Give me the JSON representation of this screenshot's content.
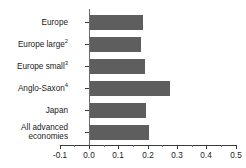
{
  "chart_data": {
    "type": "bar",
    "orientation": "horizontal",
    "title": "",
    "subtitle": "",
    "xlabel": "",
    "ylabel": "",
    "categories": [
      "Europe",
      "Europe large",
      "Europe small",
      "Anglo-Saxon",
      "Japan",
      "All advanced economies"
    ],
    "category_footnotes": [
      "",
      "2",
      "3",
      "4",
      "",
      ""
    ],
    "values": [
      0.185,
      0.178,
      0.19,
      0.275,
      0.195,
      0.205
    ],
    "xlim": [
      -0.1,
      0.5
    ],
    "xticks": [
      -0.1,
      0.0,
      0.1,
      0.2,
      0.3,
      0.4,
      0.5
    ],
    "xticklabels": [
      "-0.1",
      "0.0",
      "0.1",
      "0.2",
      "0.3",
      "0.4",
      "0.5"
    ],
    "grid": false,
    "legend": false,
    "bar_color": "#5e5e5e",
    "axis_color": "#3a3a3a",
    "background_color": "#ffffff"
  },
  "axis": {
    "tick_labels": [
      "-0.1",
      "0.0",
      "0.1",
      "0.2",
      "0.3",
      "0.4",
      "0.5"
    ]
  },
  "categories": [
    {
      "label": "Europe",
      "sup": "",
      "line1": "Europe",
      "line2": ""
    },
    {
      "label": "Europe large",
      "sup": "2",
      "line1": "Europe large",
      "line2": ""
    },
    {
      "label": "Europe small",
      "sup": "3",
      "line1": "Europe small",
      "line2": ""
    },
    {
      "label": "Anglo-Saxon",
      "sup": "4",
      "line1": "Anglo-Saxon",
      "line2": ""
    },
    {
      "label": "Japan",
      "sup": "",
      "line1": "Japan",
      "line2": ""
    },
    {
      "label": "All advanced economies",
      "sup": "",
      "line1": "All advanced",
      "line2": "economies"
    }
  ]
}
